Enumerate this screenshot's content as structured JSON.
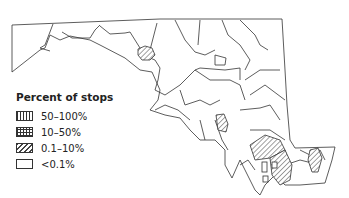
{
  "legend": {
    "title": "Percent of stops",
    "items": [
      {
        "label": "50–100%",
        "pattern": "vertical-lines"
      },
      {
        "label": "10–50%",
        "pattern": "grid"
      },
      {
        "label": "0.1–10%",
        "pattern": "diagonal-hatch"
      },
      {
        "label": "<0.1%",
        "pattern": "empty"
      }
    ]
  },
  "map": {
    "region": "Maryland counties",
    "highlighted_counties_pattern": "diagonal-hatch",
    "highlighted_count": 5,
    "colors": {
      "stroke": "#333333",
      "background": "#ffffff",
      "hatch": "#444444"
    }
  }
}
